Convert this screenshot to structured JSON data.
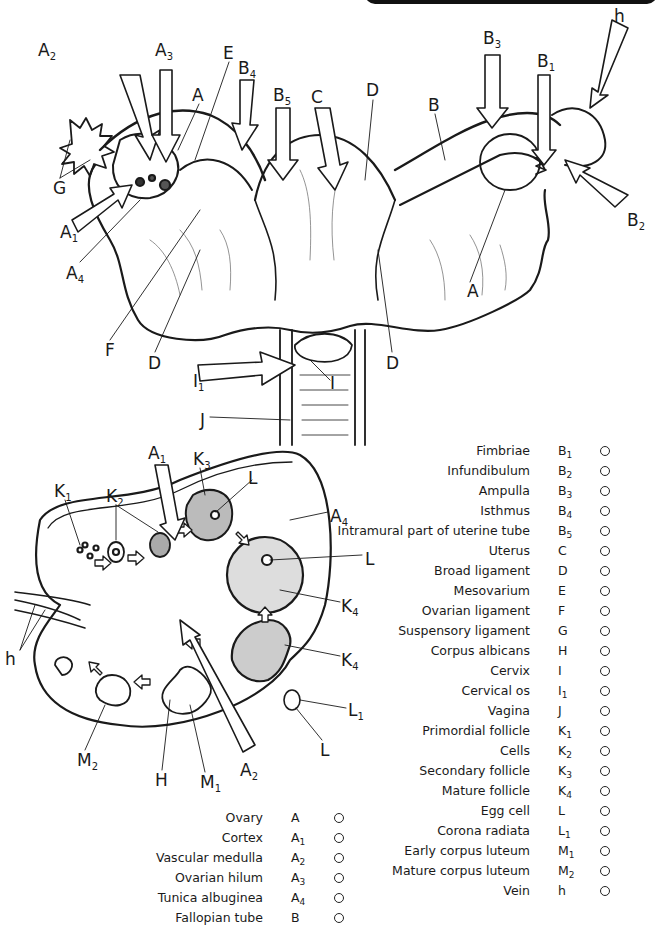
{
  "figure": {
    "title_band_color": "#111111",
    "upper_diagram": {
      "subject": "uterus-and-adnexa",
      "labels": [
        {
          "id": "A2",
          "base": "A",
          "sub": "2",
          "x": 38,
          "y": 42
        },
        {
          "id": "A3",
          "base": "A",
          "sub": "3",
          "x": 155,
          "y": 42
        },
        {
          "id": "E",
          "base": "E",
          "sub": "",
          "x": 223,
          "y": 45
        },
        {
          "id": "A_up",
          "base": "A",
          "sub": "",
          "x": 192,
          "y": 87
        },
        {
          "id": "B4",
          "base": "B",
          "sub": "4",
          "x": 238,
          "y": 60
        },
        {
          "id": "B5",
          "base": "B",
          "sub": "5",
          "x": 273,
          "y": 87
        },
        {
          "id": "C",
          "base": "C",
          "sub": "",
          "x": 311,
          "y": 89
        },
        {
          "id": "D_top",
          "base": "D",
          "sub": "",
          "x": 366,
          "y": 82
        },
        {
          "id": "B3",
          "base": "B",
          "sub": "3",
          "x": 483,
          "y": 30
        },
        {
          "id": "B1",
          "base": "B",
          "sub": "1",
          "x": 537,
          "y": 53
        },
        {
          "id": "h_top",
          "base": "h",
          "sub": "",
          "x": 614,
          "y": 8
        },
        {
          "id": "B_right",
          "base": "B",
          "sub": "",
          "x": 428,
          "y": 97
        },
        {
          "id": "G",
          "base": "G",
          "sub": "",
          "x": 53,
          "y": 180
        },
        {
          "id": "A1",
          "base": "A",
          "sub": "1",
          "x": 60,
          "y": 224
        },
        {
          "id": "B2",
          "base": "B",
          "sub": "2",
          "x": 627,
          "y": 212
        },
        {
          "id": "A4",
          "base": "A",
          "sub": "4",
          "x": 66,
          "y": 265
        },
        {
          "id": "A_right",
          "base": "A",
          "sub": "",
          "x": 467,
          "y": 283
        },
        {
          "id": "F",
          "base": "F",
          "sub": "",
          "x": 105,
          "y": 342
        },
        {
          "id": "D_left",
          "base": "D",
          "sub": "",
          "x": 148,
          "y": 355
        },
        {
          "id": "D_right",
          "base": "D",
          "sub": "",
          "x": 386,
          "y": 355
        },
        {
          "id": "I1",
          "base": "I",
          "sub": "1",
          "x": 193,
          "y": 373
        },
        {
          "id": "I",
          "base": "I",
          "sub": "",
          "x": 330,
          "y": 375
        },
        {
          "id": "J",
          "base": "J",
          "sub": "",
          "x": 200,
          "y": 412
        }
      ]
    },
    "lower_diagram": {
      "subject": "ovary-cross-section",
      "labels": [
        {
          "id": "A1_b",
          "base": "A",
          "sub": "1",
          "x": 148,
          "y": 445
        },
        {
          "id": "K3",
          "base": "K",
          "sub": "3",
          "x": 193,
          "y": 451
        },
        {
          "id": "L_b1",
          "base": "L",
          "sub": "",
          "x": 248,
          "y": 470
        },
        {
          "id": "K1",
          "base": "K",
          "sub": "1",
          "x": 54,
          "y": 483
        },
        {
          "id": "K2",
          "base": "K",
          "sub": "2",
          "x": 106,
          "y": 488
        },
        {
          "id": "A4_b",
          "base": "A",
          "sub": "4",
          "x": 330,
          "y": 508
        },
        {
          "id": "L_b2",
          "base": "L",
          "sub": "",
          "x": 365,
          "y": 551
        },
        {
          "id": "K4_a",
          "base": "K",
          "sub": "4",
          "x": 341,
          "y": 598
        },
        {
          "id": "h_b",
          "base": "h",
          "sub": "",
          "x": 5,
          "y": 651
        },
        {
          "id": "K4_b",
          "base": "K",
          "sub": "4",
          "x": 341,
          "y": 652
        },
        {
          "id": "L1",
          "base": "L",
          "sub": "1",
          "x": 348,
          "y": 702
        },
        {
          "id": "M2",
          "base": "M",
          "sub": "2",
          "x": 77,
          "y": 752
        },
        {
          "id": "L_b3",
          "base": "L",
          "sub": "",
          "x": 320,
          "y": 742
        },
        {
          "id": "H",
          "base": "H",
          "sub": "",
          "x": 155,
          "y": 772
        },
        {
          "id": "M1",
          "base": "M",
          "sub": "1",
          "x": 200,
          "y": 774
        },
        {
          "id": "A2_b",
          "base": "A",
          "sub": "2",
          "x": 240,
          "y": 762
        }
      ]
    }
  },
  "legend_left": [
    {
      "term": "Ovary",
      "code": "A",
      "sub": ""
    },
    {
      "term": "Cortex",
      "code": "A",
      "sub": "1"
    },
    {
      "term": "Vascular medulla",
      "code": "A",
      "sub": "2"
    },
    {
      "term": "Ovarian hilum",
      "code": "A",
      "sub": "3"
    },
    {
      "term": "Tunica albuginea",
      "code": "A",
      "sub": "4"
    },
    {
      "term": "Fallopian tube",
      "code": "B",
      "sub": ""
    }
  ],
  "legend_right": [
    {
      "term": "Fimbriae",
      "code": "B",
      "sub": "1"
    },
    {
      "term": "Infundibulum",
      "code": "B",
      "sub": "2"
    },
    {
      "term": "Ampulla",
      "code": "B",
      "sub": "3"
    },
    {
      "term": "Isthmus",
      "code": "B",
      "sub": "4"
    },
    {
      "term": "Intramural part of uterine tube",
      "code": "B",
      "sub": "5"
    },
    {
      "term": "Uterus",
      "code": "C",
      "sub": ""
    },
    {
      "term": "Broad ligament",
      "code": "D",
      "sub": ""
    },
    {
      "term": "Mesovarium",
      "code": "E",
      "sub": ""
    },
    {
      "term": "Ovarian ligament",
      "code": "F",
      "sub": ""
    },
    {
      "term": "Suspensory ligament",
      "code": "G",
      "sub": ""
    },
    {
      "term": "Corpus albicans",
      "code": "H",
      "sub": ""
    },
    {
      "term": "Cervix",
      "code": "I",
      "sub": ""
    },
    {
      "term": "Cervical os",
      "code": "I",
      "sub": "1"
    },
    {
      "term": "Vagina",
      "code": "J",
      "sub": ""
    },
    {
      "term": "Primordial follicle",
      "code": "K",
      "sub": "1"
    },
    {
      "term": "Cells",
      "code": "K",
      "sub": "2"
    },
    {
      "term": "Secondary follicle",
      "code": "K",
      "sub": "3"
    },
    {
      "term": "Mature follicle",
      "code": "K",
      "sub": "4"
    },
    {
      "term": "Egg cell",
      "code": "L",
      "sub": ""
    },
    {
      "term": "Corona radiata",
      "code": "L",
      "sub": "1"
    },
    {
      "term": "Early corpus luteum",
      "code": "M",
      "sub": "1"
    },
    {
      "term": "Mature corpus luteum",
      "code": "M",
      "sub": "2"
    },
    {
      "term": "Vein",
      "code": "h",
      "sub": ""
    }
  ]
}
